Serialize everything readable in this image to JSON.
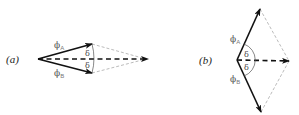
{
  "panels": [
    {
      "id": "a",
      "label": "(a)",
      "phi_a": {
        "symbol": "ϕ",
        "subscript": "A"
      },
      "phi_b": {
        "symbol": "ϕ",
        "subscript": "B"
      },
      "delta_upper": "δ",
      "delta_lower": "δ"
    },
    {
      "id": "b",
      "label": "(b)",
      "phi_a": {
        "symbol": "ϕ",
        "subscript": "A"
      },
      "phi_b": {
        "symbol": "ϕ",
        "subscript": "B"
      },
      "delta_upper": "δ",
      "delta_lower": "δ"
    }
  ],
  "colors": {
    "vector": "#111111",
    "resultant": "#111111",
    "construction": "#aaaaaa"
  }
}
